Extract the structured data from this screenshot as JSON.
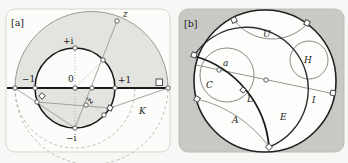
{
  "colors": {
    "page_bg": "#f7f7f5",
    "panel_a_fill": "#fcfcfa",
    "panel_a_border": "#d5d5d1",
    "panel_b_fill": "#c8c8c5",
    "panel_b_border": "#bdbdb9",
    "shade": "#e3e3df",
    "disk_fill": "#fdfdfb",
    "ink": "#1c1c1c",
    "line_gray": "#989894",
    "dashed_gray": "#b2b2ae"
  },
  "panel_a": {
    "tag": "[a]",
    "labels": {
      "z": "z",
      "plus_i": "+i",
      "minus_one": "−1",
      "zero": "0",
      "plus_one": "+1",
      "z_bar": "z̄",
      "minus_i": "−i",
      "k": "K"
    }
  },
  "panel_b": {
    "tag": "[b]",
    "labels": {
      "u": "U",
      "h": "H",
      "c": "C",
      "point_a": "a",
      "l": "L",
      "i": "I",
      "e": "E",
      "region_a": "A"
    }
  }
}
